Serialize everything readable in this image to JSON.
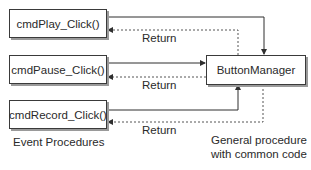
{
  "diagram": {
    "event_procedures": [
      {
        "id": "play",
        "label": "cmdPlay_Click()"
      },
      {
        "id": "pause",
        "label": "cmdPause_Click()"
      },
      {
        "id": "record",
        "label": "cmdRecord_Click()"
      }
    ],
    "general_procedure": {
      "label": "ButtonManager"
    },
    "return_labels": [
      "Return",
      "Return",
      "Return"
    ],
    "captions": {
      "left": "Event Procedures",
      "right_line1": "General procedure",
      "right_line2": "with common code"
    },
    "colors": {
      "line": "#2f2f2f",
      "dashed": "#555555",
      "shadow": "#9a9a9a",
      "background": "#ffffff"
    }
  }
}
